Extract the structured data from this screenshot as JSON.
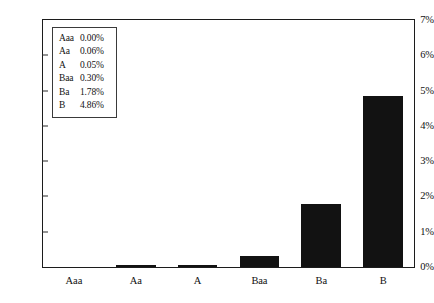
{
  "chart_data": {
    "type": "bar",
    "title": "",
    "xlabel": "",
    "ylabel": "",
    "categories": [
      "Aaa",
      "Aa",
      "A",
      "Baa",
      "Ba",
      "B"
    ],
    "values": [
      0.0,
      0.06,
      0.05,
      0.3,
      1.78,
      4.86
    ],
    "value_labels": [
      "0.00%",
      "0.06%",
      "0.05%",
      "0.30%",
      "1.78%",
      "4.86%"
    ],
    "ylim": [
      0,
      7
    ],
    "y_ticks": [
      0,
      1,
      2,
      3,
      4,
      5,
      6,
      7
    ],
    "y_tick_labels": [
      "0%",
      "1%",
      "2%",
      "3%",
      "4%",
      "5%",
      "6%",
      "7%"
    ],
    "grid": false,
    "legend_position": "upper-left-inside",
    "bar_color": "#121212",
    "frame_color": "#1c1c1c"
  },
  "legend": {
    "rows": [
      {
        "key": "Aaa",
        "value": "0.00%"
      },
      {
        "key": "Aa",
        "value": "0.06%"
      },
      {
        "key": "A",
        "value": "0.05%"
      },
      {
        "key": "Baa",
        "value": "0.30%"
      },
      {
        "key": "Ba",
        "value": "1.78%"
      },
      {
        "key": "B",
        "value": "4.86%"
      }
    ]
  }
}
